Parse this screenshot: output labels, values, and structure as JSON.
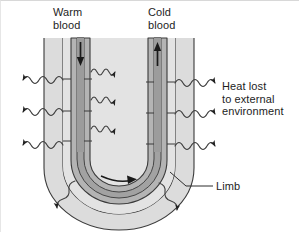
{
  "figure": {
    "background_color": "#ffffff",
    "width": 299,
    "height": 232
  },
  "labels": {
    "warm_blood": "Warm\nblood",
    "cold_blood": "Cold\nblood",
    "heat_lost": "Heat lost\nto external\nenvironment",
    "limb": "Limb"
  },
  "colors": {
    "limb_fill": "#dcdcdc",
    "interior_fill": "#e3e3e3",
    "vessel_fill": "#b0b0b0",
    "vessel_dark_fill": "#a0a0a0",
    "outline": "#3a3a3a",
    "text": "#1d1d1d",
    "arrow": "#222222",
    "wave": "#4a4a4a"
  },
  "elements": {
    "vessel_warm": "descending vessel carrying warm blood",
    "vessel_cold": "ascending vessel carrying cold blood",
    "flow_arrow_warm": "downward arrow",
    "flow_arrow_cold": "upward arrow",
    "flow_arrow_bend": "rightward arrow at U bend",
    "heat_waves_left": 3,
    "heat_waves_right": 3,
    "heat_waves_interior": 3,
    "heat_waves_bottom": 2,
    "leader_line_limb": "line from Limb label to limb outline"
  }
}
